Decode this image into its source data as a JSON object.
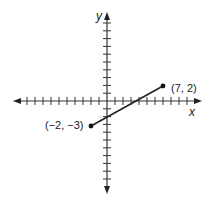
{
  "diagram": {
    "type": "coordinate-plane-segment",
    "axes": {
      "x_label": "x",
      "y_label": "y",
      "x_range": [
        -12,
        12
      ],
      "y_range": [
        -12,
        12
      ],
      "tick_interval": 1
    },
    "segment": {
      "start": {
        "x": -2,
        "y": -3,
        "label": "(−2, −3)"
      },
      "end": {
        "x": 7,
        "y": 2,
        "label": "(7, 2)"
      }
    },
    "colors": {
      "stroke": "#222222",
      "background": "#ffffff"
    }
  }
}
